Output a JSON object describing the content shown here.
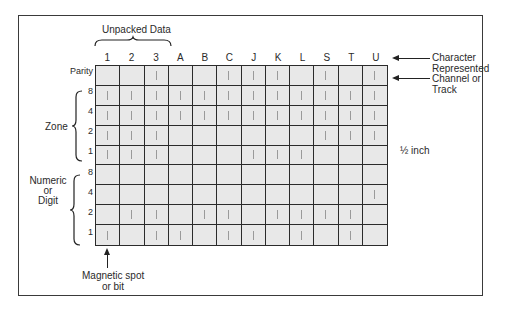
{
  "figure": {
    "top_label": "Unpacked Data",
    "columns": [
      "1",
      "2",
      "3",
      "A",
      "B",
      "C",
      "J",
      "K",
      "L",
      "S",
      "T",
      "U"
    ],
    "rows": [
      {
        "group": "parity",
        "label": "Parity",
        "bits": [
          0,
          0,
          1,
          0,
          0,
          1,
          1,
          1,
          0,
          1,
          0,
          1
        ]
      },
      {
        "group": "zone",
        "label": "8",
        "bits": [
          1,
          1,
          1,
          1,
          1,
          1,
          1,
          1,
          1,
          1,
          1,
          1
        ]
      },
      {
        "group": "zone",
        "label": "4",
        "bits": [
          1,
          1,
          1,
          1,
          1,
          1,
          1,
          1,
          1,
          1,
          1,
          1
        ]
      },
      {
        "group": "zone",
        "label": "2",
        "bits": [
          1,
          1,
          1,
          0,
          0,
          0,
          0,
          0,
          0,
          1,
          1,
          1
        ]
      },
      {
        "group": "zone",
        "label": "1",
        "bits": [
          1,
          1,
          1,
          0,
          0,
          0,
          1,
          1,
          1,
          0,
          0,
          0
        ]
      },
      {
        "group": "numeric",
        "label": "8",
        "bits": [
          0,
          0,
          0,
          0,
          0,
          0,
          0,
          0,
          0,
          0,
          0,
          0
        ]
      },
      {
        "group": "numeric",
        "label": "4",
        "bits": [
          0,
          0,
          0,
          0,
          0,
          0,
          0,
          0,
          0,
          0,
          0,
          1
        ]
      },
      {
        "group": "numeric",
        "label": "2",
        "bits": [
          0,
          1,
          1,
          0,
          1,
          1,
          0,
          1,
          1,
          1,
          1,
          0
        ]
      },
      {
        "group": "numeric",
        "label": "1",
        "bits": [
          1,
          0,
          1,
          1,
          0,
          1,
          1,
          0,
          1,
          0,
          1,
          0
        ]
      }
    ],
    "group_labels": {
      "zone": "Zone",
      "numeric": [
        "Numeric",
        "or",
        "Digit"
      ]
    },
    "annotations": {
      "character_represented": [
        "Character",
        "Represented"
      ],
      "channel_or_track": [
        "Channel or",
        "Track"
      ],
      "width": "½ inch",
      "magnetic_spot": [
        "Magnetic spot",
        "or bit"
      ]
    },
    "colors": {
      "cell_fill": "#e8e8e8",
      "grid_line": "#2b2b2b",
      "bit_mark": "#9a9a9a",
      "frame": "#3a3a3a"
    }
  }
}
